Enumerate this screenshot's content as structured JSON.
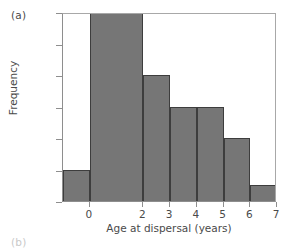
{
  "figure": {
    "panel_label": "(a)",
    "next_panel_label": "(b)"
  },
  "chart_data": {
    "type": "bar",
    "title": "",
    "subtitle": "",
    "xlabel": "Age at dispersal (years)",
    "ylabel": "Frequency",
    "categories": [
      "<0",
      "0–2",
      "2–3",
      "3–4",
      "4–5",
      "5–6",
      "6–7"
    ],
    "values": [
      2,
      12,
      8,
      6,
      6,
      4,
      1
    ],
    "bin_edges": [
      -1,
      0,
      2,
      3,
      4,
      5,
      6,
      7
    ],
    "xlim": [
      -1,
      7
    ],
    "ylim": [
      0,
      12
    ],
    "xticks": [
      0,
      2,
      3,
      4,
      5,
      6,
      7
    ],
    "xtick_labels": [
      "0",
      "2",
      "3",
      "4",
      "5",
      "6",
      "7"
    ],
    "yticks": [
      0,
      2,
      4,
      6,
      8,
      10,
      12
    ],
    "ytick_labels": [
      "0",
      "2",
      "4",
      "6",
      "8",
      "10",
      "12"
    ],
    "grid": false,
    "legend": null,
    "bar_fill_color": "#767676",
    "bar_edge_color": "#3d3d3d",
    "axis_color": "#8e8e8e",
    "text_color": "#4a4a4a",
    "background_color": "#ffffff"
  }
}
